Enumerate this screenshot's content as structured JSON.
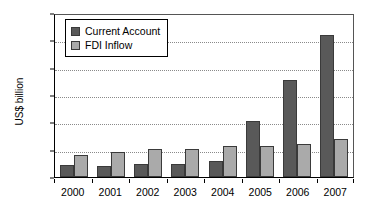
{
  "chart_data": {
    "type": "bar",
    "title": "",
    "xlabel": "",
    "ylabel": "US$ billion",
    "ylim": [
      0,
      300
    ],
    "yticks": [
      0,
      50,
      100,
      150,
      200,
      250,
      300
    ],
    "grid": true,
    "legend_position": "top-left-inside",
    "categories": [
      "2000",
      "2001",
      "2002",
      "2003",
      "2004",
      "2005",
      "2006",
      "2007"
    ],
    "series": [
      {
        "name": "Current Account",
        "color": "#595959",
        "values": [
          22,
          20,
          23,
          23,
          30,
          103,
          178,
          260
        ]
      },
      {
        "name": "FDI Inflow",
        "color": "#aaaaaa",
        "values": [
          40,
          45,
          52,
          52,
          57,
          57,
          60,
          70
        ]
      }
    ]
  },
  "colors": {
    "series_current_account": "#595959",
    "series_fdi_inflow": "#aaaaaa",
    "axis": "#000000",
    "gridline": "#8a8a8a",
    "background": "#ffffff"
  }
}
